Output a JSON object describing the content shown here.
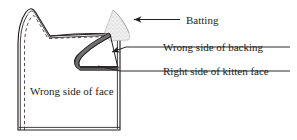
{
  "figure": {
    "type": "line-diagram",
    "background_color": "#ffffff",
    "ink_color": "#231f20",
    "batting_fill_color": "#ededed",
    "strip_fill_color": "#6e6e6e"
  },
  "labels": {
    "batting": "Batting",
    "wrong_side_backing": "Wrong side of backing",
    "right_side_kitten_face": "Right side of kitten face",
    "wrong_side_face": "Wrong side of face"
  },
  "callouts": [
    {
      "id": "batting",
      "label": "Batting",
      "marker": "arrowhead",
      "text_x": 186,
      "text_y": 23
    },
    {
      "id": "wrong-side-backing",
      "label": "Wrong side of backing",
      "marker": "arrowhead",
      "text_x": 163,
      "text_y": 51
    },
    {
      "id": "right-side-kitten-face",
      "label": "Right side of kitten face",
      "marker": "leader-line",
      "text_x": 163,
      "text_y": 75
    }
  ],
  "inner_labels": [
    {
      "id": "wrong-side-face",
      "label": "Wrong side of face",
      "text_x": 30,
      "text_y": 95
    }
  ]
}
